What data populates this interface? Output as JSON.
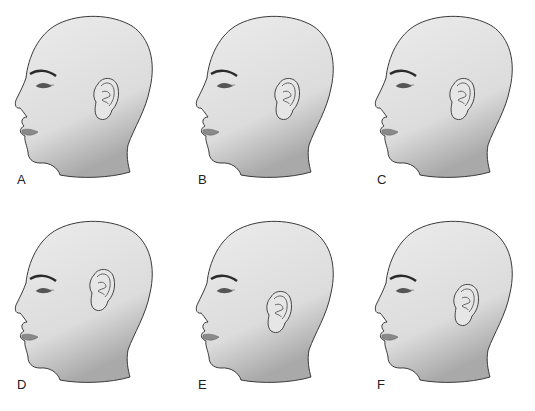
{
  "figure": {
    "panels": [
      {
        "label": "A",
        "ear": {
          "cx": 104,
          "cy": 98,
          "rot": 0
        }
      },
      {
        "label": "B",
        "ear": {
          "cx": 104,
          "cy": 98,
          "rot": 0
        }
      },
      {
        "label": "C",
        "ear": {
          "cx": 100,
          "cy": 98,
          "rot": 0
        }
      },
      {
        "label": "D",
        "ear": {
          "cx": 100,
          "cy": 84,
          "rot": 0
        }
      },
      {
        "label": "E",
        "ear": {
          "cx": 96,
          "cy": 106,
          "rot": 0
        }
      },
      {
        "label": "F",
        "ear": {
          "cx": 104,
          "cy": 99,
          "rot": 0
        }
      }
    ]
  },
  "colors": {
    "skin": "#e3e3e3",
    "outline": "#3a3a3a",
    "lips": "#8a8a8a",
    "brow": "#2a2a2a",
    "background": "#ffffff"
  }
}
